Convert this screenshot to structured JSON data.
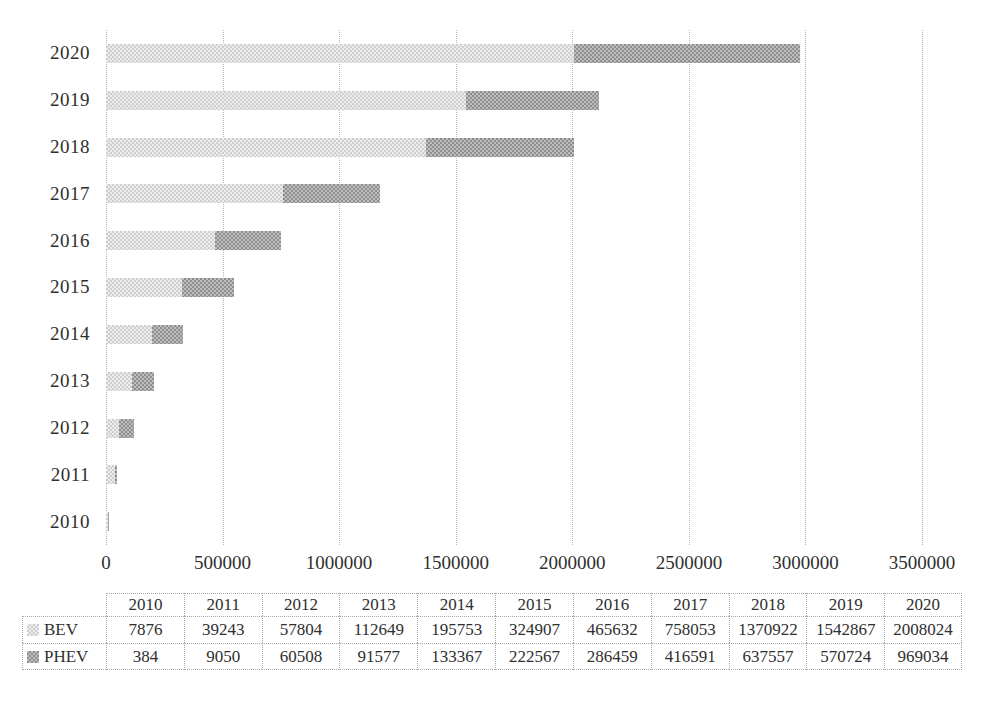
{
  "chart_data": {
    "type": "bar",
    "orientation": "horizontal",
    "stacked": true,
    "title": "",
    "xlabel": "",
    "ylabel": "",
    "categories": [
      "2010",
      "2011",
      "2012",
      "2013",
      "2014",
      "2015",
      "2016",
      "2017",
      "2018",
      "2019",
      "2020"
    ],
    "category_order_top_to_bottom": [
      "2020",
      "2019",
      "2018",
      "2017",
      "2016",
      "2015",
      "2014",
      "2013",
      "2012",
      "2011",
      "2010"
    ],
    "series": [
      {
        "name": "BEV",
        "values": [
          7876,
          39243,
          57804,
          112649,
          195753,
          324907,
          465632,
          758053,
          1370922,
          1542867,
          2008024
        ]
      },
      {
        "name": "PHEV",
        "values": [
          384,
          9050,
          60508,
          91577,
          133367,
          222567,
          286459,
          416591,
          637557,
          570724,
          969034
        ]
      }
    ],
    "xlim": [
      0,
      3500000
    ],
    "x_ticks": [
      0,
      500000,
      1000000,
      1500000,
      2000000,
      2500000,
      3000000,
      3500000
    ],
    "grid": true,
    "gridline_style": "dotted",
    "legend_position": "data-table-left",
    "data_table_shown": true,
    "colors": {
      "bev_checker_dark": "#cfcfcf",
      "bev_checker_light": "#ececec",
      "phev_checker_dark": "#8f8f8f",
      "phev_checker_light": "#bdbdbd",
      "gridline": "#b5b5b5",
      "text": "#2f2f2f",
      "table_border": "#a8a8a8"
    }
  }
}
